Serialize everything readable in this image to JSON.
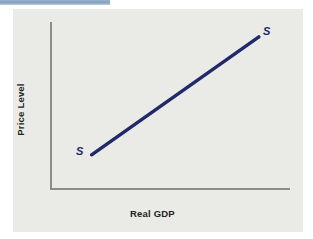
{
  "figure": {
    "background_color": "#eaebe6",
    "accent_rule_color": "#7e9dc0",
    "axis_color": "#8c8c86",
    "curve_color": "#21296b"
  },
  "axes": {
    "y_title": "Price Level",
    "x_title": "Real GDP"
  },
  "labels": {
    "curve_lower": "S",
    "curve_upper": "S"
  },
  "chart_data": {
    "type": "line",
    "title": "",
    "xlabel": "Real GDP",
    "ylabel": "Price Level",
    "legend": [],
    "grid": false,
    "xlim": [
      0,
      100
    ],
    "ylim": [
      0,
      100
    ],
    "axis_ticks": {
      "x": [],
      "y": []
    },
    "series": [
      {
        "name": "S",
        "kind": "upward-sloping-supply-curve",
        "color": "#21296b",
        "x": [
          17,
          87
        ],
        "y": [
          20,
          91
        ],
        "endpoint_labels": [
          "S",
          "S"
        ]
      }
    ],
    "annotations": [
      {
        "text": "S",
        "x": 13,
        "y": 21,
        "style": "bold-italic"
      },
      {
        "text": "S",
        "x": 91,
        "y": 93,
        "style": "bold-italic"
      }
    ]
  }
}
